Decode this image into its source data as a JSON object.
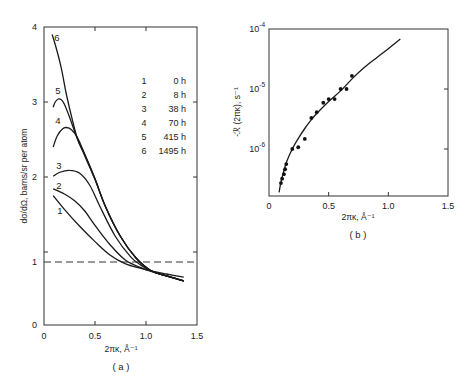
{
  "chart_data": [
    {
      "id": "a",
      "type": "line",
      "panel_label": "( a )",
      "xlabel": "2πκ, Å⁻¹",
      "ylabel": "dσ/dΩ, barns/sr per atom",
      "xlim": [
        0,
        1.5
      ],
      "ylim": [
        0,
        4
      ],
      "x_ticks": [
        {
          "value": 0,
          "label": "0"
        },
        {
          "value": 0.5,
          "label": "0.5"
        },
        {
          "value": 1.0,
          "label": "1.0"
        },
        {
          "value": 1.5,
          "label": "1.5"
        }
      ],
      "y_ticks": [
        {
          "value": 0,
          "label": "0"
        },
        {
          "value": 1,
          "label": "1"
        },
        {
          "value": 2,
          "label": "2"
        },
        {
          "value": 3,
          "label": "3"
        },
        {
          "value": 4,
          "label": "4"
        }
      ],
      "reference_line": {
        "y": 1,
        "style": "dashed"
      },
      "legend": {
        "placement": "top-right",
        "entries": [
          {
            "id": "1",
            "label": "0 h"
          },
          {
            "id": "2",
            "label": "8 h"
          },
          {
            "id": "3",
            "label": "38 h"
          },
          {
            "id": "4",
            "label": "70 h"
          },
          {
            "id": "5",
            "label": "415 h"
          },
          {
            "id": "6",
            "label": "1495 h"
          }
        ]
      },
      "series": [
        {
          "name": "1",
          "time": "0 h",
          "x": [
            0.09,
            0.2,
            0.35,
            0.5,
            0.65,
            0.8,
            0.95,
            1.05,
            1.2,
            1.37
          ],
          "y": [
            1.78,
            1.62,
            1.42,
            1.24,
            1.08,
            0.97,
            0.9,
            0.86,
            0.81,
            0.76
          ]
        },
        {
          "name": "2",
          "time": "8 h",
          "x": [
            0.09,
            0.2,
            0.3,
            0.4,
            0.5,
            0.65,
            0.8,
            0.95,
            1.05,
            1.2,
            1.37
          ],
          "y": [
            1.86,
            1.8,
            1.72,
            1.6,
            1.43,
            1.2,
            1.02,
            0.91,
            0.85,
            0.78,
            0.7
          ]
        },
        {
          "name": "3",
          "time": "38 h",
          "x": [
            0.09,
            0.15,
            0.25,
            0.35,
            0.45,
            0.55,
            0.7,
            0.85,
            0.95,
            1.05,
            1.2,
            1.37
          ],
          "y": [
            2.01,
            2.06,
            2.09,
            2.05,
            1.9,
            1.65,
            1.3,
            1.06,
            0.95,
            0.86,
            0.78,
            0.7
          ]
        },
        {
          "name": "4",
          "time": "70 h",
          "x": [
            0.09,
            0.13,
            0.18,
            0.22,
            0.27,
            0.33,
            0.4,
            0.5,
            0.6,
            0.75,
            0.9,
            1.05,
            1.2,
            1.37
          ],
          "y": [
            2.4,
            2.55,
            2.64,
            2.66,
            2.63,
            2.52,
            2.3,
            1.98,
            1.66,
            1.3,
            1.05,
            0.86,
            0.78,
            0.7
          ]
        },
        {
          "name": "5",
          "time": "415 h",
          "x": [
            0.09,
            0.11,
            0.14,
            0.17,
            0.2,
            0.25,
            0.33,
            0.4,
            0.5,
            0.6,
            0.75,
            0.9,
            1.05,
            1.2,
            1.37
          ],
          "y": [
            2.93,
            3.0,
            3.04,
            3.03,
            2.97,
            2.8,
            2.5,
            2.3,
            1.98,
            1.66,
            1.3,
            1.05,
            0.86,
            0.78,
            0.7
          ]
        },
        {
          "name": "6",
          "time": "1495 h",
          "x": [
            0.08,
            0.12,
            0.17,
            0.22,
            0.28,
            0.33,
            0.4,
            0.5,
            0.6,
            0.75,
            0.9,
            1.05,
            1.2,
            1.37
          ],
          "y": [
            3.9,
            3.72,
            3.45,
            3.1,
            2.75,
            2.5,
            2.28,
            1.97,
            1.66,
            1.3,
            1.05,
            0.86,
            0.78,
            0.7
          ]
        }
      ],
      "curve_labels": [
        {
          "name": "6",
          "x": 0.1,
          "y": 3.86
        },
        {
          "name": "5",
          "x": 0.11,
          "y": 3.15
        },
        {
          "name": "4",
          "x": 0.11,
          "y": 2.75
        },
        {
          "name": "3",
          "x": 0.12,
          "y": 2.15
        },
        {
          "name": "2",
          "x": 0.12,
          "y": 1.9
        },
        {
          "name": "1",
          "x": 0.13,
          "y": 1.6
        }
      ]
    },
    {
      "id": "b",
      "type": "scatter",
      "panel_label": "( b )",
      "xlabel": "2πκ, Å⁻¹",
      "ylabel": "-ℛ (2πκ), s⁻¹",
      "xlim": [
        0,
        1.5
      ],
      "ylim": [
        1.8e-07,
        0.0001
      ],
      "y_scale": "log",
      "x_ticks": [
        {
          "value": 0,
          "label": "0"
        },
        {
          "value": 0.5,
          "label": "0.5"
        },
        {
          "value": 1.0,
          "label": "1.0"
        },
        {
          "value": 1.5,
          "label": "1.5"
        }
      ],
      "y_ticks": [
        {
          "value": 1e-06,
          "base": "10",
          "exp": "-6"
        },
        {
          "value": 1e-05,
          "base": "10",
          "exp": "-5"
        },
        {
          "value": 0.0001,
          "base": "10",
          "exp": "-4"
        }
      ],
      "points": {
        "x": [
          0.1,
          0.11,
          0.125,
          0.135,
          0.145,
          0.195,
          0.245,
          0.3,
          0.355,
          0.4,
          0.455,
          0.5,
          0.55,
          0.6,
          0.65,
          0.695
        ],
        "y": [
          2.7e-07,
          3.2e-07,
          3.8e-07,
          4.6e-07,
          5.6e-07,
          1e-06,
          1.07e-06,
          1.47e-06,
          3.3e-06,
          4.1e-06,
          5.9e-06,
          6.8e-06,
          6.8e-06,
          1e-05,
          1e-05,
          1.65e-05
        ]
      },
      "fit_curve": {
        "x": [
          0.085,
          0.1,
          0.12,
          0.15,
          0.2,
          0.25,
          0.3,
          0.35,
          0.4,
          0.5,
          0.6,
          0.7,
          0.8,
          0.9,
          1.0,
          1.1
        ],
        "y": [
          1.9e-07,
          2.8e-07,
          4e-07,
          6.3e-07,
          1.05e-06,
          1.55e-06,
          2.2e-06,
          3e-06,
          3.9e-06,
          6.2e-06,
          9.3e-06,
          1.5e-05,
          2.3e-05,
          3.3e-05,
          4.7e-05,
          6.8e-05
        ]
      }
    }
  ]
}
